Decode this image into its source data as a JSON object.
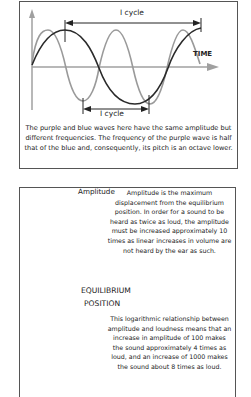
{
  "top_diagram": {
    "cycle_label_top": "I cycle",
    "cycle_label_bottom": "I cycle",
    "time_axis_label": "TIME",
    "caption": "The purple and blue waves here have the same amplitude but different frequencies. The frequency of the purple wave is half that of the blue and, consequently, its pitch is an octave lower.",
    "colors": {
      "high_freq_wave": "#9a9a9a",
      "low_freq_wave": "#2a2a2a",
      "axis": "#a0a0a0"
    }
  },
  "bottom_diagram": {
    "amplitude_label": "Amplitude",
    "equilibrium_label": "EQUILIBRIUM",
    "position_label": "POSITION",
    "amplitude_text": "Amplitude is the maximum displacement from the equilibrium position. In order for a sound to be heard as twice as loud, the amplitude must be increased approximately 10 times as linear increases in volume are not heard by the ear as such.",
    "logarithmic_text": "This logarithmic relationship between amplitude and loudness means that an increase in amplitude of 100 makes the sound approximately 4 times as loud, and an increase of 1000 makes the sound about 8 times as loud.",
    "colors": {
      "wave": "#9a9a9a",
      "arrow": "#222222"
    }
  }
}
